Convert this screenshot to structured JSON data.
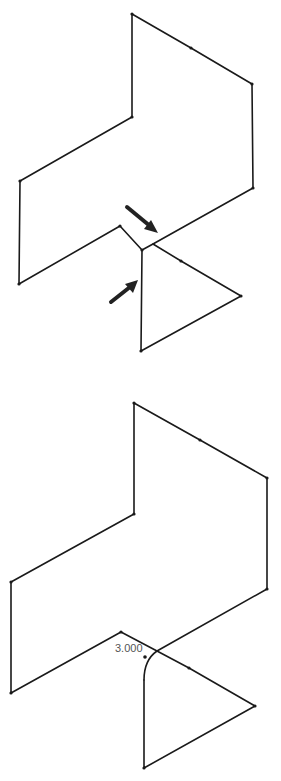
{
  "figure": {
    "top_view": {
      "description": "3D sketch of an open polyline before fillet; arrows indicate the sharp corner to be rounded",
      "arrows": [
        "upper-pointer-arrow",
        "lower-pointer-arrow"
      ]
    },
    "bottom_view": {
      "description": "Same 3D sketch after a sketch fillet is applied at the corner",
      "dimension_label": "3.000"
    },
    "colors": {
      "line": "#1a1a1a",
      "label": "#555555",
      "background": "#ffffff"
    }
  }
}
